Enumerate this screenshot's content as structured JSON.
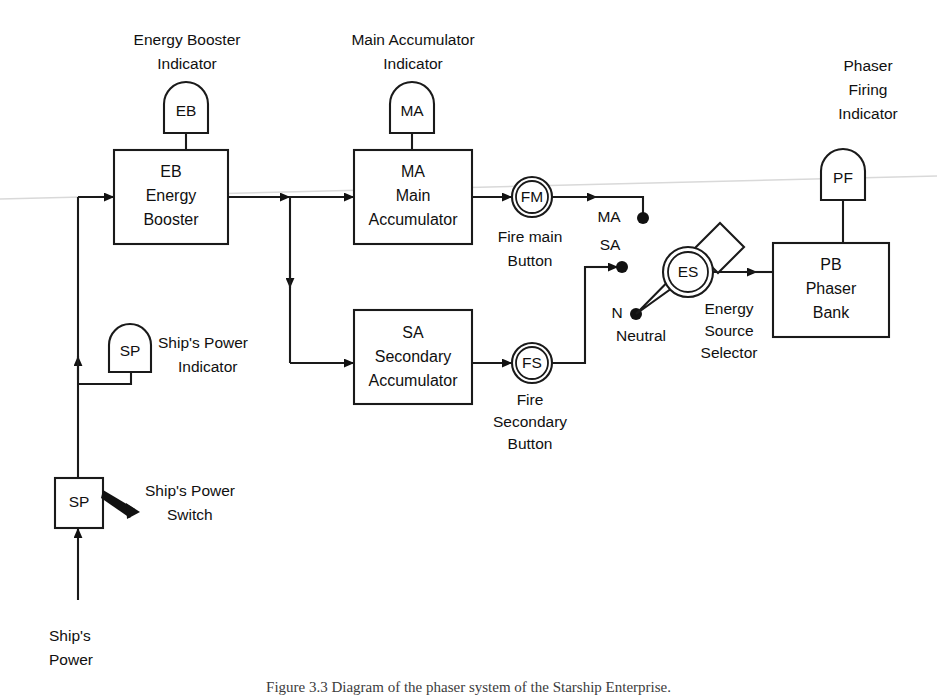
{
  "figure": {
    "background_color": "#ffffff",
    "line_color": "#1a1a1a",
    "caption": "Figure 3.3  Diagram of the phaser system of the Starship Enterprise."
  },
  "blocks": [
    {
      "id": "eb",
      "code": "EB",
      "line2": "Energy",
      "line3": "Booster"
    },
    {
      "id": "ma",
      "code": "MA",
      "line2": "Main",
      "line3": "Accumulator"
    },
    {
      "id": "sa",
      "code": "SA",
      "line2": "Secondary",
      "line3": "Accumulator"
    },
    {
      "id": "pb",
      "code": "PB",
      "line2": "Phaser",
      "line3": "Bank"
    }
  ],
  "indicators": [
    {
      "id": "eb_ind",
      "code": "EB",
      "label_line1": "Energy Booster",
      "label_line2": "Indicator"
    },
    {
      "id": "ma_ind",
      "code": "MA",
      "label_line1": "Main Accumulator",
      "label_line2": "Indicator"
    },
    {
      "id": "pf_ind",
      "code": "PF",
      "label_line1": "Phaser",
      "label_line2": "Firing",
      "label_line3": "Indicator"
    },
    {
      "id": "sp_ind",
      "code": "SP",
      "label_line1": "Ship's Power",
      "label_line2": "Indicator"
    }
  ],
  "buttons": [
    {
      "id": "fm",
      "code": "FM",
      "label_line1": "Fire main",
      "label_line2": "Button"
    },
    {
      "id": "fs",
      "code": "FS",
      "label_line1": "Fire",
      "label_line2": "Secondary",
      "label_line3": "Button"
    }
  ],
  "selector": {
    "id": "es",
    "code": "ES",
    "label_line1": "Energy",
    "label_line2": "Source",
    "label_line3": "Selector"
  },
  "terminals": [
    {
      "id": "term_ma",
      "label": "MA"
    },
    {
      "id": "term_sa",
      "label": "SA"
    },
    {
      "id": "term_n",
      "label": "N",
      "sublabel": "Neutral"
    }
  ],
  "switch": {
    "id": "sp_switch",
    "code": "SP",
    "label_line1": "Ship's Power",
    "label_line2": "Switch"
  },
  "source": {
    "id": "ships_power_input",
    "label_line1": "Ship's",
    "label_line2": "Power"
  }
}
